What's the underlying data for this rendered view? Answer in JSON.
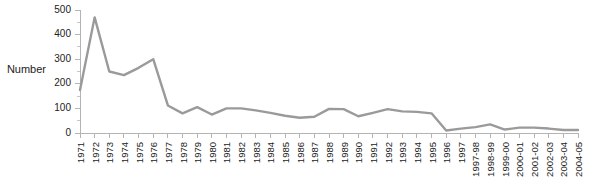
{
  "chart_data": {
    "type": "line",
    "title": "",
    "xlabel": "",
    "ylabel": "Number",
    "ylim": [
      0,
      500
    ],
    "ytick_step": 100,
    "yticks": [
      0,
      100,
      200,
      300,
      400,
      500
    ],
    "minor_ytick_step": 50,
    "grid": false,
    "legend": false,
    "line_color": "#9a9a9a",
    "axis_color": "#b4b4b4",
    "text_color": "#222222",
    "categories": [
      "1971",
      "1972",
      "1973",
      "1974",
      "1975",
      "1976",
      "1977",
      "1978",
      "1979",
      "1980",
      "1981",
      "1982",
      "1983",
      "1984",
      "1985",
      "1986",
      "1987",
      "1988",
      "1989",
      "1990",
      "1991",
      "1992",
      "1993",
      "1994",
      "1995",
      "1996",
      "1997",
      "1997-98",
      "1998-99",
      "1999-00",
      "2000-01",
      "2001-02",
      "2002-03",
      "2003-04",
      "2004-05"
    ],
    "values": [
      175,
      470,
      250,
      235,
      265,
      300,
      112,
      80,
      105,
      75,
      100,
      100,
      92,
      82,
      70,
      62,
      66,
      98,
      97,
      68,
      82,
      97,
      88,
      86,
      80,
      10,
      18,
      24,
      35,
      14,
      22,
      22,
      18,
      12,
      12
    ]
  }
}
